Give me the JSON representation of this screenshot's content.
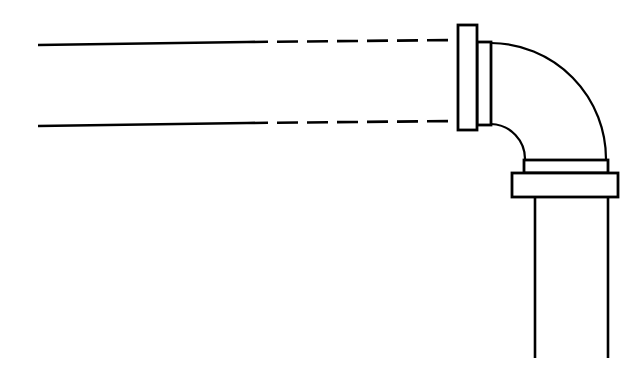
{
  "canvas": {
    "width": 641,
    "height": 380,
    "background_color": "#ffffff",
    "line_color": "#000000"
  },
  "drawing": {
    "title": "Flanged 90-degree pipe elbow assembly",
    "style": "technical line drawing",
    "stroke_widths": {
      "pipe_wall": 2.6,
      "flange_outline": 2.8,
      "arc": 2.2,
      "dashed": 2.6
    },
    "dash_pattern": {
      "dash_length": 21,
      "gap_length": 9,
      "pattern": "21 9"
    }
  },
  "parts": {
    "horizontal_pipe": {
      "name": "horizontal-pipe-run",
      "description": "Horizontal pipe run shown with solid lines at left transitioning to dashed break lines toward the flange",
      "top_wall_solid": {
        "x1": 38,
        "y1": 45,
        "x2": 247,
        "y2": 42
      },
      "top_wall_dashed": {
        "x1": 247,
        "y1": 42,
        "x2": 458,
        "y2": 40
      },
      "bottom_wall_solid": {
        "x1": 38,
        "y1": 126,
        "x2": 247,
        "y2": 123
      },
      "bottom_wall_dashed": {
        "x1": 247,
        "y1": 123,
        "x2": 458,
        "y2": 121
      }
    },
    "vertical_flange": {
      "name": "vertical-mating-flange",
      "description": "Raised-face bolted flange at the horizontal pipe inlet, drawn as an outer face plate and an inner hub collar",
      "face_plate": {
        "x": 458,
        "y": 25,
        "width": 19,
        "height": 105
      },
      "hub_collar": {
        "x": 477,
        "y": 42,
        "width": 14,
        "height": 83
      }
    },
    "elbow": {
      "name": "ninety-degree-elbow",
      "description": "Long radius 90 degree elbow connecting the horizontal run to the vertical downcomer",
      "outer_arc": {
        "start_x": 491,
        "start_y": 43,
        "end_x": 606,
        "end_y": 160,
        "radius": 116,
        "sweep": 1
      },
      "inner_arc": {
        "start_x": 491,
        "start_y": 124,
        "end_x": 525,
        "end_y": 160,
        "radius": 35,
        "sweep": 1
      }
    },
    "bottom_flange": {
      "name": "bottom-bolted-flange",
      "description": "Two-tier bolted flange joint at the elbow outlet, upper raised face and lower flange ring",
      "raised_face": {
        "x": 524,
        "y": 160,
        "width": 84,
        "height": 13
      },
      "flange_ring": {
        "x": 512,
        "y": 173,
        "width": 106,
        "height": 24
      }
    },
    "vertical_pipe": {
      "name": "vertical-downcomer-pipe",
      "description": "Vertical pipe leaving the bottom of the flange, walls drawn as two parallel lines",
      "left_wall": {
        "x1": 535,
        "y1": 197,
        "x2": 535,
        "y2": 358
      },
      "right_wall": {
        "x1": 608,
        "y1": 197,
        "x2": 608,
        "y2": 358
      }
    }
  },
  "labels": {
    "has_text_annotations": false,
    "note": "No text, dimensions, or callouts are present in this drawing"
  }
}
